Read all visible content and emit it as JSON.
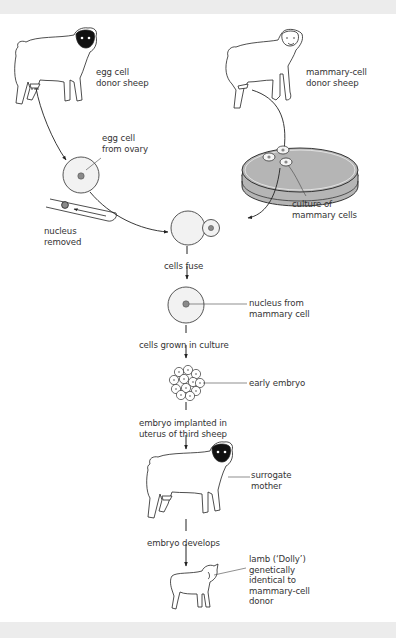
{
  "diagram": {
    "colors": {
      "background": "#ffffff",
      "frame": "#ececec",
      "line": "#222222",
      "text": "#333333",
      "cell_fill": "#f2f2f2",
      "nucleus_fill": "#8a8a8a",
      "dish_fill": "#b5b5b5",
      "sheep_face": "#111111"
    },
    "labels": {
      "egg_donor": "egg cell\ndonor sheep",
      "mammary_donor": "mammary-cell\ndonor sheep",
      "egg_cell": "egg cell\nfrom ovary",
      "culture": "culture of\nmammary cells",
      "nucleus_removed": "nucleus\nremoved",
      "cells_fuse": "cells fuse",
      "nucleus_from_mammary": "nucleus from\nmammary cell",
      "cells_grown": "cells grown in culture",
      "early_embryo": "early embryo",
      "embryo_implanted": "embryo implanted in\nuterus of third sheep",
      "surrogate": "surrogate\nmother",
      "embryo_develops": "embryo develops",
      "lamb": "lamb (‘Dolly’)\ngenetically\nidentical to\nmammary-cell\ndonor"
    },
    "icons": [
      "sheep-black-face-icon",
      "sheep-white-face-icon",
      "egg-cell-icon",
      "petri-dish-icon",
      "micropipette-icon",
      "fused-cells-icon",
      "embryo-cluster-icon",
      "lamb-icon"
    ]
  }
}
